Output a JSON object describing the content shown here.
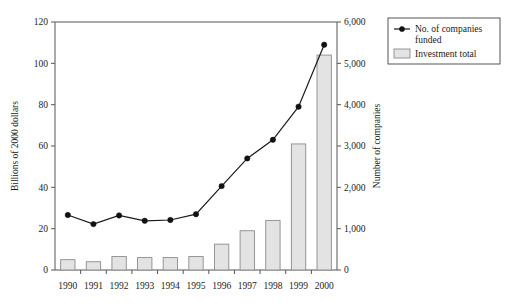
{
  "chart_data": {
    "type": "bar",
    "title": "",
    "subtitle": "",
    "xlabel": "",
    "ylabel": "Billions of 2000 dollars",
    "y2label": "Number of companies",
    "categories": [
      "1990",
      "1991",
      "1992",
      "1993",
      "1994",
      "1995",
      "1996",
      "1997",
      "1998",
      "1999",
      "2000"
    ],
    "ylim": [
      0,
      120
    ],
    "y2lim": [
      0,
      6000
    ],
    "yticks": [
      0,
      20,
      40,
      60,
      80,
      100,
      120
    ],
    "ytick_labels": [
      "0",
      "20",
      "40",
      "60",
      "80",
      "100",
      "120"
    ],
    "y2ticks": [
      0,
      1000,
      2000,
      3000,
      4000,
      5000,
      6000
    ],
    "y2tick_labels": [
      "0",
      "1,000",
      "2,000",
      "3,000",
      "4,000",
      "5,000",
      "6,000"
    ],
    "grid": false,
    "legend_position": "upper-right-outside",
    "series": [
      {
        "name": "Investment total",
        "type": "bar",
        "axis": "left",
        "unit": "Billions of 2000 dollars",
        "values": [
          5,
          4,
          6.5,
          6,
          6,
          6.5,
          12.5,
          19,
          24,
          61,
          104
        ]
      },
      {
        "name": "No. of companies funded",
        "type": "line",
        "axis": "right",
        "unit": "Number of companies",
        "values": [
          1330,
          1110,
          1320,
          1190,
          1210,
          1350,
          2030,
          2700,
          3150,
          3950,
          5450
        ]
      }
    ]
  },
  "legend": {
    "entries": [
      {
        "label_line1": "No. of companies",
        "label_line2": "funded",
        "marker": "line-marker-icon"
      },
      {
        "label_line1": "Investment total",
        "label_line2": "",
        "marker": "bar-swatch-icon"
      }
    ]
  },
  "axes": {
    "left_title": "Billions of 2000 dollars",
    "right_title": "Number of companies"
  }
}
